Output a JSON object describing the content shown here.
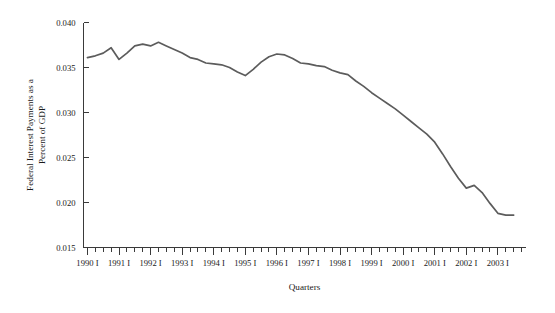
{
  "chart_data": {
    "type": "line",
    "title": "",
    "xlabel": "Quarters",
    "ylabel": "Federal Interest Payments as a Percent of GDP",
    "ylabel_line1": "Federal Interest Payments as a",
    "ylabel_line2": "Percent of GDP",
    "ylim": [
      0.015,
      0.04
    ],
    "ytick_labels": [
      "0.040",
      "0.035",
      "0.030",
      "0.025",
      "0.020",
      "0.015"
    ],
    "ytick_values": [
      0.04,
      0.035,
      0.03,
      0.025,
      0.02,
      0.015
    ],
    "xtick_labels": [
      "1990 I",
      "1991 I",
      "1992 I",
      "1993 I",
      "1994 I",
      "1995 I",
      "1996 I",
      "1997 I",
      "1998 I",
      "1999 I",
      "2000 I",
      "2001 I",
      "2002 I",
      "2003 I"
    ],
    "grid": false,
    "legend": "none",
    "line_color": "#5c5c5c",
    "axis_color": "#3a3a3a",
    "background_color": "#ffffff",
    "x": [
      "1990 I",
      "1990 II",
      "1990 III",
      "1990 IV",
      "1991 I",
      "1991 II",
      "1991 III",
      "1991 IV",
      "1992 I",
      "1992 II",
      "1992 III",
      "1992 IV",
      "1993 I",
      "1993 II",
      "1993 III",
      "1993 IV",
      "1994 I",
      "1994 II",
      "1994 III",
      "1994 IV",
      "1995 I",
      "1995 II",
      "1995 III",
      "1995 IV",
      "1996 I",
      "1996 II",
      "1996 III",
      "1996 IV",
      "1997 I",
      "1997 II",
      "1997 III",
      "1997 IV",
      "1998 I",
      "1998 II",
      "1998 III",
      "1998 IV",
      "1999 I",
      "1999 II",
      "1999 III",
      "1999 IV",
      "2000 I",
      "2000 II",
      "2000 III",
      "2000 IV",
      "2001 I",
      "2001 II",
      "2001 III",
      "2001 IV",
      "2002 I",
      "2002 II",
      "2002 III",
      "2002 IV",
      "2003 I",
      "2003 II",
      "2003 III"
    ],
    "values": [
      0.0361,
      0.0363,
      0.0366,
      0.0372,
      0.0359,
      0.0366,
      0.0374,
      0.0376,
      0.0374,
      0.0378,
      0.0374,
      0.037,
      0.0366,
      0.0361,
      0.0359,
      0.0355,
      0.0354,
      0.0353,
      0.035,
      0.0345,
      0.0341,
      0.0348,
      0.0356,
      0.0362,
      0.0365,
      0.0364,
      0.036,
      0.0355,
      0.0354,
      0.0352,
      0.0351,
      0.0347,
      0.0344,
      0.0342,
      0.0335,
      0.0329,
      0.0322,
      0.0316,
      0.031,
      0.0304,
      0.0297,
      0.029,
      0.0283,
      0.0276,
      0.0267,
      0.0254,
      0.024,
      0.0227,
      0.0216,
      0.0219,
      0.0211,
      0.0199,
      0.0188,
      0.0186,
      0.0186
    ]
  }
}
